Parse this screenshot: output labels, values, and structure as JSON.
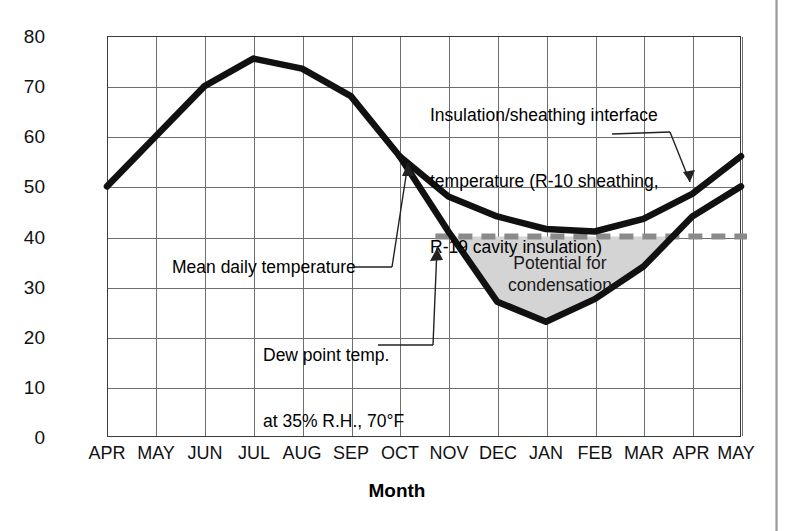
{
  "chart_data": {
    "type": "line",
    "title": "",
    "xlabel": "Month",
    "ylabel": "Temperature (°F)",
    "ylim": [
      0,
      80
    ],
    "ytick_step": 10,
    "yticks": [
      "80",
      "70",
      "60",
      "50",
      "40",
      "30",
      "20",
      "10",
      "0"
    ],
    "categories": [
      "APR",
      "MAY",
      "JUN",
      "JUL",
      "AUG",
      "SEP",
      "OCT",
      "NOV",
      "DEC",
      "JAN",
      "FEB",
      "MAR",
      "APR",
      "MAY"
    ],
    "grid": true,
    "legend": "none",
    "series": [
      {
        "name": "Mean daily temperature",
        "values": [
          50,
          60,
          70,
          75.5,
          73.5,
          68,
          56,
          41,
          27,
          23,
          27.5,
          34,
          44,
          50
        ]
      },
      {
        "name": "Insulation/sheathing interface temperature (R-10 sheathing, R-19 cavity insulation)",
        "values": [
          null,
          null,
          null,
          null,
          null,
          null,
          56,
          48,
          44,
          41.5,
          41,
          43.5,
          48.5,
          56
        ]
      }
    ],
    "threshold_line": {
      "name": "Dew point temp. at 35% R.H., 70°F",
      "value": 40,
      "style": "dashed",
      "color": "#8a8a8a",
      "x_start_category": "NOV",
      "x_end_category": "MAY"
    },
    "shaded_region": {
      "label": "Potential for condensation",
      "fill": "#d4d4d4",
      "between": [
        "Mean daily temperature",
        "Dew point 40°F"
      ],
      "from_category": "NOV",
      "to_category": "APR"
    }
  },
  "axes": {
    "y_title": "Temperature (°F)",
    "x_title": "Month",
    "y_ticks": [
      "80",
      "70",
      "60",
      "50",
      "40",
      "30",
      "20",
      "10",
      "0"
    ],
    "x_ticks": [
      "APR",
      "MAY",
      "JUN",
      "JUL",
      "AUG",
      "SEP",
      "OCT",
      "NOV",
      "DEC",
      "JAN",
      "FEB",
      "MAR",
      "APR",
      "MAY"
    ]
  },
  "annotations": {
    "interface": {
      "line1": "Insulation/sheathing interface",
      "line2": "temperature (R-10 sheathing,",
      "line3": "R-19 cavity insulation)"
    },
    "mean_daily": "Mean daily temperature",
    "dew_point": {
      "line1": "Dew point temp.",
      "line2": "at 35% R.H., 70°F"
    },
    "condensation": {
      "line1": "Potential for",
      "line2": "condensation"
    }
  },
  "colors": {
    "curve": "#111111",
    "grid": "#6e6e6e",
    "frame": "#3a3a3a",
    "dew_dash": "#8a8a8a",
    "shade": "#d4d4d4"
  }
}
